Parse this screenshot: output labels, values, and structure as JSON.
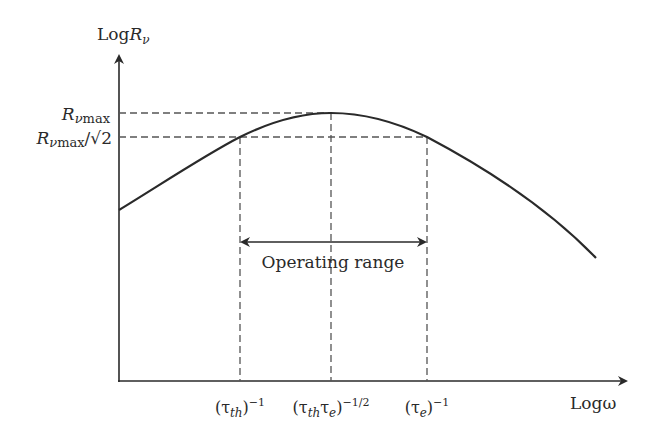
{
  "axes": {
    "y_label_prefix": "Log",
    "y_label_var": "R",
    "y_label_sub": "ν",
    "x_label": "Logω"
  },
  "y_ticks": {
    "max": {
      "var": "R",
      "sub": "νmax"
    },
    "half": {
      "var": "R",
      "sub": "νmax",
      "suffix": "/√2"
    }
  },
  "x_ticks": [
    {
      "open": "(τ",
      "sub": "th",
      "close": ")",
      "sup": "−1"
    },
    {
      "open": "(τ",
      "sub": "th",
      "mid": "τ",
      "sub2": "e",
      "close": ")",
      "sup": "−1/2"
    },
    {
      "open": "(τ",
      "sub": "e",
      "close": ")",
      "sup": "−1"
    }
  ],
  "annotation": {
    "label": "Operating range"
  },
  "colors": {
    "curve": "#2a2a2a",
    "dashed": "#555555",
    "text": "#2a2a2a"
  }
}
